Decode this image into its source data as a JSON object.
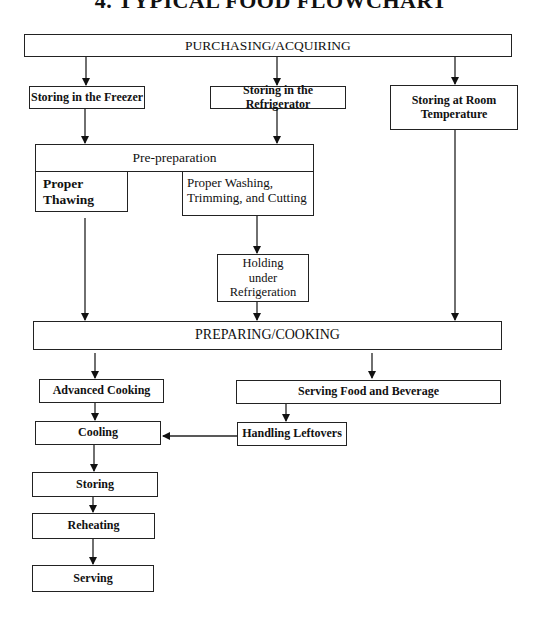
{
  "title": "4. TYPICAL FOOD FLOWCHART",
  "nodes": {
    "purchasing": "PURCHASING/ACQUIRING",
    "freezer": "Storing in the Freezer",
    "refrigerator": "Storing in the Refrigerator",
    "room_temp": "Storing at Room\nTemperature",
    "pre_preparation": "Pre-preparation",
    "thawing": "Proper\nThawing",
    "washing": "Proper Washing,\nTrimming, and Cutting",
    "holding": "Holding\nunder\nRefrigeration",
    "preparing": "PREPARING/COOKING",
    "advanced_cooking": "Advanced Cooking",
    "serving_food": "Serving Food and Beverage",
    "cooling": "Cooling",
    "leftovers": "Handling Leftovers",
    "storing": "Storing",
    "reheating": "Reheating",
    "serving": "Serving"
  },
  "edges": [
    [
      "purchasing",
      "freezer"
    ],
    [
      "purchasing",
      "refrigerator"
    ],
    [
      "purchasing",
      "room_temp"
    ],
    [
      "freezer",
      "pre_preparation"
    ],
    [
      "refrigerator",
      "pre_preparation"
    ],
    [
      "thawing",
      "preparing"
    ],
    [
      "washing",
      "holding"
    ],
    [
      "holding",
      "preparing"
    ],
    [
      "room_temp",
      "preparing"
    ],
    [
      "preparing",
      "advanced_cooking"
    ],
    [
      "preparing",
      "serving_food"
    ],
    [
      "advanced_cooking",
      "cooling"
    ],
    [
      "serving_food",
      "leftovers"
    ],
    [
      "leftovers",
      "cooling"
    ],
    [
      "cooling",
      "storing"
    ],
    [
      "storing",
      "reheating"
    ],
    [
      "reheating",
      "serving"
    ]
  ]
}
